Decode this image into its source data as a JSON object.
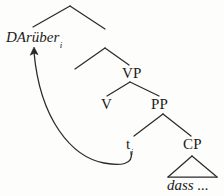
{
  "figure": {
    "kind": "syntax-tree-diagram",
    "background_color": "#fdfdfc",
    "ink_color": "#1b1b1b"
  },
  "tree": {
    "moved_constituent": {
      "text": "DArüber",
      "subscript": "i"
    },
    "nodes": {
      "vp": "VP",
      "v": "V",
      "pp": "PP",
      "cp": "CP"
    },
    "trace": {
      "text": "t",
      "subscript": "i"
    },
    "terminal": {
      "text": "dass ..."
    }
  },
  "movement_arrow": {
    "from": "trace",
    "to": "moved_constituent",
    "style": "curved-arrow"
  }
}
